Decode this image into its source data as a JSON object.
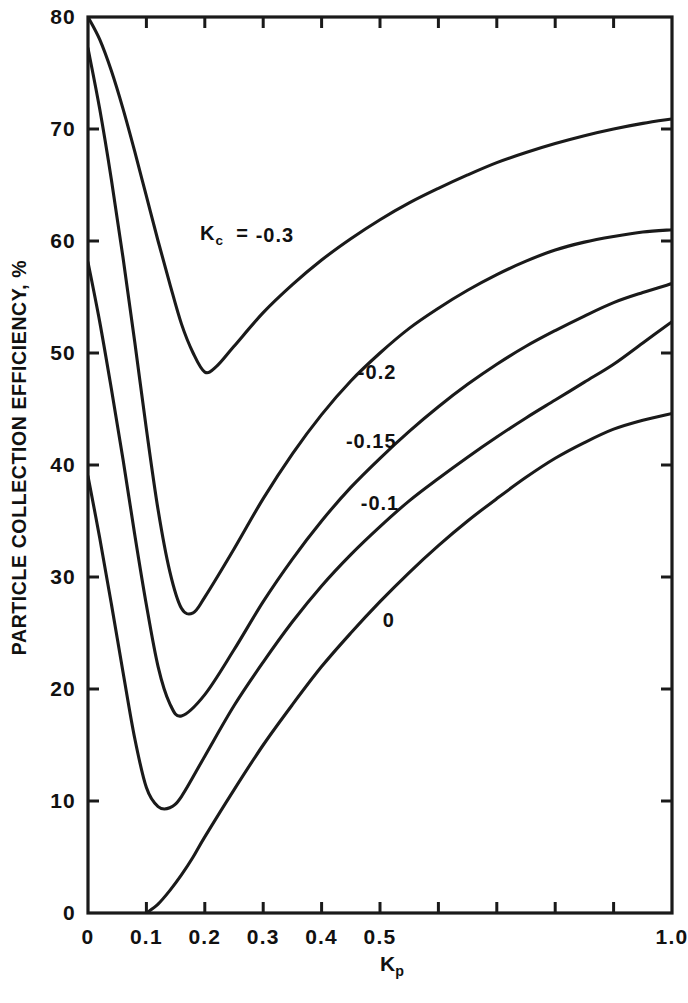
{
  "chart_data": {
    "type": "line",
    "title": "",
    "xlabel": "K_p",
    "ylabel": "PARTICLE COLLECTION EFFICIENCY, %",
    "xlim": [
      0,
      1.0
    ],
    "ylim": [
      0,
      80
    ],
    "grid": false,
    "legend": "inline-curve-labels",
    "xticks": [
      0,
      0.1,
      0.2,
      0.3,
      0.4,
      0.5,
      0.6,
      0.7,
      0.8,
      0.9,
      1.0
    ],
    "xtick_labels": [
      "0",
      "0.1",
      "0.2",
      "0.3",
      "0.4",
      "0.5",
      "",
      "",
      "",
      "",
      "1.0"
    ],
    "yticks": [
      0,
      10,
      20,
      30,
      40,
      50,
      60,
      70,
      80
    ],
    "ytick_labels": [
      "0",
      "10",
      "20",
      "30",
      "40",
      "50",
      "60",
      "70",
      "80"
    ],
    "series": [
      {
        "name": "Kc = -0.3",
        "label": "-0.3",
        "label_x": 0.32,
        "label_y": 60.5,
        "x": [
          0.0,
          0.02,
          0.04,
          0.06,
          0.08,
          0.1,
          0.12,
          0.14,
          0.16,
          0.18,
          0.2,
          0.22,
          0.25,
          0.3,
          0.35,
          0.4,
          0.45,
          0.5,
          0.55,
          0.6,
          0.65,
          0.7,
          0.75,
          0.8,
          0.85,
          0.9,
          0.95,
          1.0
        ],
        "y": [
          80.0,
          78.0,
          75.2,
          71.8,
          68.0,
          64.0,
          60.0,
          56.2,
          52.6,
          50.0,
          48.3,
          48.8,
          50.6,
          53.6,
          56.1,
          58.3,
          60.2,
          61.9,
          63.4,
          64.7,
          65.9,
          67.0,
          67.9,
          68.7,
          69.4,
          70.0,
          70.5,
          70.9
        ]
      },
      {
        "name": "Kc = -0.2",
        "label": "-0.2",
        "label_x": 0.495,
        "label_y": 48.3,
        "x": [
          0.0,
          0.02,
          0.04,
          0.06,
          0.08,
          0.1,
          0.12,
          0.14,
          0.16,
          0.18,
          0.2,
          0.25,
          0.3,
          0.35,
          0.4,
          0.45,
          0.5,
          0.55,
          0.6,
          0.65,
          0.7,
          0.75,
          0.8,
          0.85,
          0.9,
          0.95,
          1.0
        ],
        "y": [
          77.2,
          71.8,
          65.5,
          58.5,
          51.0,
          43.2,
          36.0,
          30.5,
          27.2,
          26.8,
          28.2,
          32.5,
          37.0,
          41.0,
          44.5,
          47.5,
          50.0,
          52.2,
          54.0,
          55.6,
          57.0,
          58.2,
          59.2,
          59.9,
          60.4,
          60.8,
          61.0
        ]
      },
      {
        "name": "Kc = -0.15",
        "label": "-0.15",
        "label_x": 0.485,
        "label_y": 42.1,
        "x": [
          0.0,
          0.02,
          0.04,
          0.06,
          0.08,
          0.1,
          0.12,
          0.14,
          0.16,
          0.2,
          0.25,
          0.3,
          0.35,
          0.4,
          0.45,
          0.5,
          0.55,
          0.6,
          0.65,
          0.7,
          0.75,
          0.8,
          0.85,
          0.9,
          0.95,
          1.0
        ],
        "y": [
          58.1,
          52.8,
          46.8,
          40.5,
          33.8,
          27.5,
          22.0,
          18.7,
          17.6,
          19.5,
          23.5,
          27.8,
          31.6,
          35.0,
          38.0,
          40.6,
          43.0,
          45.2,
          47.2,
          49.0,
          50.6,
          52.0,
          53.3,
          54.5,
          55.4,
          56.2
        ]
      },
      {
        "name": "Kc = -0.1",
        "label": "-0.1",
        "label_x": 0.5,
        "label_y": 36.6,
        "x": [
          0.0,
          0.02,
          0.04,
          0.06,
          0.08,
          0.1,
          0.12,
          0.14,
          0.16,
          0.2,
          0.25,
          0.3,
          0.35,
          0.4,
          0.45,
          0.5,
          0.55,
          0.6,
          0.65,
          0.7,
          0.75,
          0.8,
          0.85,
          0.9,
          0.95,
          1.0
        ],
        "y": [
          39.0,
          33.5,
          27.6,
          21.5,
          15.6,
          11.2,
          9.5,
          9.4,
          10.4,
          14.0,
          18.5,
          22.4,
          26.0,
          29.2,
          32.0,
          34.5,
          36.8,
          38.8,
          40.7,
          42.5,
          44.2,
          45.8,
          47.4,
          49.0,
          50.9,
          52.8
        ]
      },
      {
        "name": "Kc = 0",
        "label": "0",
        "label_x": 0.515,
        "label_y": 26.2,
        "x": [
          0.1,
          0.12,
          0.14,
          0.16,
          0.18,
          0.2,
          0.25,
          0.3,
          0.35,
          0.4,
          0.45,
          0.5,
          0.55,
          0.6,
          0.65,
          0.7,
          0.75,
          0.8,
          0.85,
          0.9,
          0.95,
          1.0
        ],
        "y": [
          0.0,
          0.8,
          2.0,
          3.4,
          5.0,
          6.8,
          11.0,
          15.0,
          18.6,
          22.0,
          25.0,
          27.8,
          30.4,
          32.8,
          35.0,
          37.0,
          38.9,
          40.6,
          42.0,
          43.2,
          44.0,
          44.6
        ]
      }
    ],
    "group_label": {
      "text_prefix": "K",
      "text_sub": "c",
      "text_eq": "=",
      "x": 0.245,
      "y": 60.5
    }
  },
  "axes": {
    "x_title_main": "K",
    "x_title_sub": "p",
    "y_title": "PARTICLE COLLECTION EFFICIENCY, %"
  },
  "style": {
    "line_color": "#1a1a1a",
    "axis_color": "#1a1a1a",
    "background": "#ffffff"
  }
}
